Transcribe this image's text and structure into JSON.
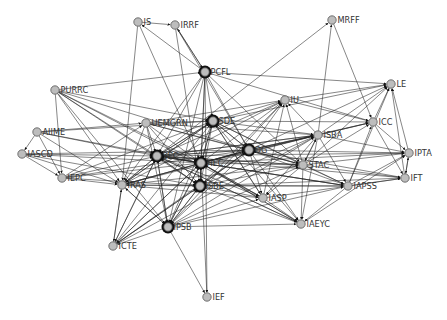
{
  "diagram": {
    "type": "directed-network",
    "background": "#ffffff",
    "node_fill": "#bdbdbd",
    "edge_color": "#222222",
    "nodes": [
      {
        "id": "IS",
        "label": "IS",
        "x": 138,
        "y": 22,
        "hub": false
      },
      {
        "id": "IRRF",
        "label": "IRRF",
        "x": 175,
        "y": 25,
        "hub": false
      },
      {
        "id": "MRFF",
        "label": "MRFF",
        "x": 332,
        "y": 20,
        "hub": false
      },
      {
        "id": "PCFL",
        "label": "PCFL",
        "x": 205,
        "y": 72,
        "hub": true
      },
      {
        "id": "LE",
        "label": "LE",
        "x": 391,
        "y": 84,
        "hub": false
      },
      {
        "id": "PURRC",
        "label": "PURRC",
        "x": 55,
        "y": 90,
        "hub": false
      },
      {
        "id": "IU",
        "label": "IU",
        "x": 285,
        "y": 100,
        "hub": false
      },
      {
        "id": "ICC",
        "label": "ICC",
        "x": 373,
        "y": 122,
        "hub": false
      },
      {
        "id": "SDE",
        "label": "SDE",
        "x": 213,
        "y": 121,
        "hub": true
      },
      {
        "id": "UEMGRN",
        "label": "UEMGRN",
        "x": 146,
        "y": 123,
        "hub": false
      },
      {
        "id": "ISBA",
        "label": "ISBA",
        "x": 318,
        "y": 135,
        "hub": false
      },
      {
        "id": "AIIME",
        "label": "AIIME",
        "x": 37,
        "y": 132,
        "hub": false
      },
      {
        "id": "OG",
        "label": "OG",
        "x": 249,
        "y": 150,
        "hub": true
      },
      {
        "id": "IPTA",
        "label": "IPTA",
        "x": 409,
        "y": 153,
        "hub": false
      },
      {
        "id": "IASCD",
        "label": "IASCD",
        "x": 22,
        "y": 154,
        "hub": false
      },
      {
        "id": "SEC",
        "label": "SEC",
        "x": 157,
        "y": 156,
        "hub": true
      },
      {
        "id": "HEC",
        "label": "HEC",
        "x": 201,
        "y": 163,
        "hub": true
      },
      {
        "id": "STAC",
        "label": "STAC",
        "x": 303,
        "y": 165,
        "hub": false
      },
      {
        "id": "IFT",
        "label": "IFT",
        "x": 405,
        "y": 178,
        "hub": false
      },
      {
        "id": "IEPC",
        "label": "IEPC",
        "x": 62,
        "y": 178,
        "hub": false
      },
      {
        "id": "IRAS",
        "label": "IRAS",
        "x": 122,
        "y": 185,
        "hub": false
      },
      {
        "id": "ISBE",
        "label": "ISBE",
        "x": 200,
        "y": 186,
        "hub": true
      },
      {
        "id": "IAPSS",
        "label": "IAPSS",
        "x": 348,
        "y": 186,
        "hub": false
      },
      {
        "id": "IASP",
        "label": "IASP",
        "x": 263,
        "y": 198,
        "hub": false
      },
      {
        "id": "IAEYC",
        "label": "IAEYC",
        "x": 301,
        "y": 224,
        "hub": false
      },
      {
        "id": "IPSB",
        "label": "IPSB",
        "x": 168,
        "y": 227,
        "hub": true
      },
      {
        "id": "ICTE",
        "label": "ICTE",
        "x": 113,
        "y": 246,
        "hub": false
      },
      {
        "id": "IEF",
        "label": "IEF",
        "x": 207,
        "y": 297,
        "hub": false
      }
    ],
    "edges": [
      [
        "IS",
        "IRRF"
      ],
      [
        "PCFL",
        "IS"
      ],
      [
        "PCFL",
        "IRRF"
      ],
      [
        "IRRF",
        "PCFL"
      ],
      [
        "IS",
        "IRAS"
      ],
      [
        "IRRF",
        "ISBE"
      ],
      [
        "IRRF",
        "OG"
      ],
      [
        "IS",
        "HEC"
      ],
      [
        "MRFF",
        "ICC"
      ],
      [
        "ISBA",
        "MRFF"
      ],
      [
        "SEC",
        "MRFF"
      ],
      [
        "PURRC",
        "PCFL"
      ],
      [
        "PCFL",
        "LE"
      ],
      [
        "PCFL",
        "SEC"
      ],
      [
        "PCFL",
        "HEC"
      ],
      [
        "PCFL",
        "SDE"
      ],
      [
        "PCFL",
        "ISBE"
      ],
      [
        "PCFL",
        "OG"
      ],
      [
        "PCFL",
        "IPSB"
      ],
      [
        "PCFL",
        "IEF"
      ],
      [
        "PCFL",
        "ICC"
      ],
      [
        "PCFL",
        "STAC"
      ],
      [
        "PCFL",
        "IRAS"
      ],
      [
        "IU",
        "LE"
      ],
      [
        "ICC",
        "LE"
      ],
      [
        "IPTA",
        "LE"
      ],
      [
        "IFT",
        "LE"
      ],
      [
        "ISBA",
        "LE"
      ],
      [
        "STAC",
        "LE"
      ],
      [
        "SDE",
        "LE"
      ],
      [
        "OG",
        "LE"
      ],
      [
        "IAPSS",
        "LE"
      ],
      [
        "ICC",
        "IPTA"
      ],
      [
        "ICC",
        "IFT"
      ],
      [
        "IPTA",
        "IFT"
      ],
      [
        "IFT",
        "IPTA"
      ],
      [
        "ISBA",
        "ICC"
      ],
      [
        "STAC",
        "ICC"
      ],
      [
        "OG",
        "ICC"
      ],
      [
        "IU",
        "ICC"
      ],
      [
        "IAPSS",
        "ICC"
      ],
      [
        "HEC",
        "ICC"
      ],
      [
        "SDE",
        "ICC"
      ],
      [
        "SEC",
        "IPTA"
      ],
      [
        "HEC",
        "IPTA"
      ],
      [
        "OG",
        "IPTA"
      ],
      [
        "ISBA",
        "IPTA"
      ],
      [
        "STAC",
        "IPTA"
      ],
      [
        "IAPSS",
        "IFT"
      ],
      [
        "ISBE",
        "IFT"
      ],
      [
        "STAC",
        "IFT"
      ],
      [
        "OG",
        "IFT"
      ],
      [
        "SEC",
        "IFT"
      ],
      [
        "IASP",
        "IFT"
      ],
      [
        "SEC",
        "IU"
      ],
      [
        "HEC",
        "IU"
      ],
      [
        "SDE",
        "IU"
      ],
      [
        "OG",
        "IU"
      ],
      [
        "ISBE",
        "IU"
      ],
      [
        "IPSB",
        "IU"
      ],
      [
        "IRAS",
        "IU"
      ],
      [
        "UEMGRN",
        "IU"
      ],
      [
        "IASP",
        "IU"
      ],
      [
        "STAC",
        "IU"
      ],
      [
        "ISBA",
        "IU"
      ],
      [
        "PURRC",
        "SEC"
      ],
      [
        "PURRC",
        "HEC"
      ],
      [
        "PURRC",
        "ISBE"
      ],
      [
        "PURRC",
        "IRAS"
      ],
      [
        "PURRC",
        "IPSB"
      ],
      [
        "PURRC",
        "OG"
      ],
      [
        "PURRC",
        "SDE"
      ],
      [
        "PURRC",
        "IEPC"
      ],
      [
        "PURRC",
        "IASP"
      ],
      [
        "AIIME",
        "UEMGRN"
      ],
      [
        "AIIME",
        "SEC"
      ],
      [
        "AIIME",
        "HEC"
      ],
      [
        "AIIME",
        "IASCD"
      ],
      [
        "AIIME",
        "IEPC"
      ],
      [
        "AIIME",
        "SDE"
      ],
      [
        "AIIME",
        "IRAS"
      ],
      [
        "IASCD",
        "SEC"
      ],
      [
        "IASCD",
        "HEC"
      ],
      [
        "IASCD",
        "IEPC"
      ],
      [
        "IASCD",
        "ISBE"
      ],
      [
        "IASCD",
        "OG"
      ],
      [
        "IASCD",
        "IRAS"
      ],
      [
        "IEPC",
        "SEC"
      ],
      [
        "IEPC",
        "HEC"
      ],
      [
        "IEPC",
        "ISBE"
      ],
      [
        "IEPC",
        "IRAS"
      ],
      [
        "IEPC",
        "OG"
      ],
      [
        "IEPC",
        "SDE"
      ],
      [
        "IEPC",
        "UEMGRN"
      ],
      [
        "UEMGRN",
        "SDE"
      ],
      [
        "UEMGRN",
        "SEC"
      ],
      [
        "UEMGRN",
        "HEC"
      ],
      [
        "UEMGRN",
        "OG"
      ],
      [
        "UEMGRN",
        "ISBE"
      ],
      [
        "UEMGRN",
        "IRAS"
      ],
      [
        "UEMGRN",
        "IPSB"
      ],
      [
        "UEMGRN",
        "ISBA"
      ],
      [
        "UEMGRN",
        "STAC"
      ],
      [
        "SEC",
        "HEC"
      ],
      [
        "HEC",
        "SEC"
      ],
      [
        "SEC",
        "SDE"
      ],
      [
        "SDE",
        "SEC"
      ],
      [
        "SEC",
        "ISBE"
      ],
      [
        "ISBE",
        "SEC"
      ],
      [
        "SEC",
        "OG"
      ],
      [
        "OG",
        "SEC"
      ],
      [
        "SEC",
        "IRAS"
      ],
      [
        "IRAS",
        "SEC"
      ],
      [
        "SEC",
        "IPSB"
      ],
      [
        "IPSB",
        "SEC"
      ],
      [
        "SEC",
        "ISBA"
      ],
      [
        "SEC",
        "STAC"
      ],
      [
        "SEC",
        "IAPSS"
      ],
      [
        "SEC",
        "IASP"
      ],
      [
        "SEC",
        "IAEYC"
      ],
      [
        "SEC",
        "ICTE"
      ],
      [
        "HEC",
        "SDE"
      ],
      [
        "SDE",
        "HEC"
      ],
      [
        "HEC",
        "ISBE"
      ],
      [
        "ISBE",
        "HEC"
      ],
      [
        "HEC",
        "OG"
      ],
      [
        "OG",
        "HEC"
      ],
      [
        "HEC",
        "IRAS"
      ],
      [
        "HEC",
        "IPSB"
      ],
      [
        "IPSB",
        "HEC"
      ],
      [
        "HEC",
        "ISBA"
      ],
      [
        "HEC",
        "STAC"
      ],
      [
        "HEC",
        "IAPSS"
      ],
      [
        "HEC",
        "IASP"
      ],
      [
        "HEC",
        "IAEYC"
      ],
      [
        "HEC",
        "ICTE"
      ],
      [
        "HEC",
        "IEF"
      ],
      [
        "SDE",
        "OG"
      ],
      [
        "OG",
        "SDE"
      ],
      [
        "SDE",
        "ISBE"
      ],
      [
        "SDE",
        "ISBA"
      ],
      [
        "SDE",
        "STAC"
      ],
      [
        "SDE",
        "IAPSS"
      ],
      [
        "SDE",
        "IASP"
      ],
      [
        "SDE",
        "IAEYC"
      ],
      [
        "SDE",
        "IPSB"
      ],
      [
        "SDE",
        "IRAS"
      ],
      [
        "OG",
        "ISBE"
      ],
      [
        "ISBE",
        "OG"
      ],
      [
        "OG",
        "ISBA"
      ],
      [
        "ISBA",
        "OG"
      ],
      [
        "OG",
        "STAC"
      ],
      [
        "STAC",
        "OG"
      ],
      [
        "OG",
        "IAPSS"
      ],
      [
        "OG",
        "IASP"
      ],
      [
        "OG",
        "IAEYC"
      ],
      [
        "OG",
        "IPSB"
      ],
      [
        "OG",
        "IRAS"
      ],
      [
        "ISBE",
        "IRAS"
      ],
      [
        "ISBE",
        "IPSB"
      ],
      [
        "IPSB",
        "ISBE"
      ],
      [
        "ISBE",
        "ISBA"
      ],
      [
        "ISBE",
        "STAC"
      ],
      [
        "ISBE",
        "IAPSS"
      ],
      [
        "ISBE",
        "IASP"
      ],
      [
        "ISBE",
        "IAEYC"
      ],
      [
        "ISBE",
        "ICTE"
      ],
      [
        "ISBA",
        "STAC"
      ],
      [
        "STAC",
        "ISBA"
      ],
      [
        "ISBA",
        "IAPSS"
      ],
      [
        "ISBA",
        "IAEYC"
      ],
      [
        "ISBA",
        "IASP"
      ],
      [
        "STAC",
        "IAPSS"
      ],
      [
        "STAC",
        "IAEYC"
      ],
      [
        "STAC",
        "IASP"
      ],
      [
        "IAPSS",
        "IAEYC"
      ],
      [
        "IASP",
        "IAEYC"
      ],
      [
        "IRAS",
        "IPSB"
      ],
      [
        "IPSB",
        "IRAS"
      ],
      [
        "IRAS",
        "ICTE"
      ],
      [
        "ICTE",
        "IRAS"
      ],
      [
        "IPSB",
        "ICTE"
      ],
      [
        "IPSB",
        "IEF"
      ],
      [
        "IPSB",
        "IAEYC"
      ],
      [
        "IPSB",
        "IASP"
      ],
      [
        "IPSB",
        "IAPSS"
      ],
      [
        "IPSB",
        "STAC"
      ],
      [
        "IPSB",
        "ISBA"
      ],
      [
        "ICTE",
        "SEC"
      ],
      [
        "ICTE",
        "HEC"
      ],
      [
        "ICTE",
        "OG"
      ],
      [
        "ICTE",
        "ISBE"
      ],
      [
        "ICTE",
        "SDE"
      ],
      [
        "ICTE",
        "ISBA"
      ],
      [
        "IRAS",
        "ISBA"
      ],
      [
        "IRAS",
        "STAC"
      ],
      [
        "IRAS",
        "IAPSS"
      ],
      [
        "IRAS",
        "IASP"
      ],
      [
        "IRAS",
        "OG"
      ],
      [
        "IRAS",
        "SDE"
      ],
      [
        "IASP",
        "HEC"
      ],
      [
        "IASP",
        "SDE"
      ],
      [
        "IAPSS",
        "SEC"
      ],
      [
        "IAEYC",
        "SEC"
      ],
      [
        "IAEYC",
        "HEC"
      ],
      [
        "STAC",
        "SEC"
      ],
      [
        "ISBA",
        "SEC"
      ],
      [
        "IAPSS",
        "IPTA"
      ],
      [
        "IAEYC",
        "IPTA"
      ]
    ]
  }
}
